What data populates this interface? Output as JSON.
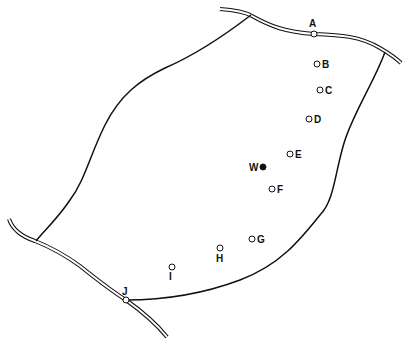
{
  "map": {
    "width": 411,
    "height": 347,
    "colors": {
      "line": "#111111",
      "road_fill": "#ffffff",
      "point_fill": "#ffffff",
      "filled_point": "#111111"
    },
    "points": [
      {
        "id": "A",
        "label": "A",
        "x": 314,
        "y": 34,
        "lx": 309,
        "ly": 27,
        "type": "open"
      },
      {
        "id": "B",
        "label": "B",
        "x": 317,
        "y": 64,
        "lx": 322,
        "ly": 68,
        "type": "open"
      },
      {
        "id": "C",
        "label": "C",
        "x": 320,
        "y": 90,
        "lx": 325,
        "ly": 94,
        "type": "open"
      },
      {
        "id": "D",
        "label": "D",
        "x": 309,
        "y": 119,
        "lx": 314,
        "ly": 123,
        "type": "open"
      },
      {
        "id": "E",
        "label": "E",
        "x": 290,
        "y": 154,
        "lx": 295,
        "ly": 158,
        "type": "open"
      },
      {
        "id": "W",
        "label": "W",
        "x": 263,
        "y": 167,
        "lx": 249,
        "ly": 171,
        "type": "filled"
      },
      {
        "id": "F",
        "label": "F",
        "x": 272,
        "y": 189,
        "lx": 277,
        "ly": 193,
        "type": "open"
      },
      {
        "id": "G",
        "label": "G",
        "x": 252,
        "y": 239,
        "lx": 257,
        "ly": 243,
        "type": "open"
      },
      {
        "id": "H",
        "label": "H",
        "x": 220,
        "y": 248,
        "lx": 216,
        "ly": 262,
        "type": "open"
      },
      {
        "id": "I",
        "label": "I",
        "x": 172,
        "y": 267,
        "lx": 169,
        "ly": 280,
        "type": "open"
      },
      {
        "id": "J",
        "label": "J",
        "x": 126,
        "y": 300,
        "lx": 122,
        "ly": 295,
        "type": "open"
      }
    ]
  }
}
